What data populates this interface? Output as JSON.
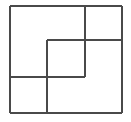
{
  "figure": {
    "title": "Overlapping rectangles pinwheel figure",
    "background_color": "#ffffff",
    "stroke_color": "#4a4a4a",
    "stroke_color_dark": "#3a3a3a",
    "stroke_width": 1.3,
    "canvas": {
      "width": 131,
      "height": 122
    },
    "outer_square": {
      "name": "outer-square",
      "left": 10,
      "top": 6,
      "right": 122,
      "bottom": 113,
      "width": 112,
      "height": 107
    },
    "inner_square": {
      "name": "inner-square",
      "left": 47,
      "top": 40,
      "right": 85,
      "bottom": 77,
      "width": 38,
      "height": 37
    },
    "segments": [
      {
        "id": "outer-top",
        "label": "Outer square top edge",
        "orientation": "horizontal",
        "x1": 10,
        "y1": 6,
        "x2": 122,
        "y2": 6
      },
      {
        "id": "outer-right",
        "label": "Outer square right edge",
        "orientation": "vertical",
        "x1": 122,
        "y1": 6,
        "x2": 122,
        "y2": 113
      },
      {
        "id": "outer-bottom",
        "label": "Outer square bottom edge",
        "orientation": "horizontal",
        "x1": 10,
        "y1": 113,
        "x2": 122,
        "y2": 113
      },
      {
        "id": "outer-left",
        "label": "Outer square left edge",
        "orientation": "vertical",
        "x1": 10,
        "y1": 6,
        "x2": 10,
        "y2": 113
      },
      {
        "id": "interior-vertical-upper",
        "label": "Upper interior vertical segment from top edge down to middle",
        "orientation": "vertical",
        "x1": 85,
        "y1": 6,
        "x2": 85,
        "y2": 77
      },
      {
        "id": "interior-horizontal-right",
        "label": "Interior horizontal segment from inner square across to right edge",
        "orientation": "horizontal",
        "x1": 47,
        "y1": 40,
        "x2": 122,
        "y2": 40
      },
      {
        "id": "interior-vertical-left-of-inner",
        "label": "Interior vertical segment forming inner square left side, continuing to bottom edge",
        "orientation": "vertical",
        "x1": 47,
        "y1": 40,
        "x2": 47,
        "y2": 113
      },
      {
        "id": "interior-horizontal-left",
        "label": "Interior horizontal segment from left edge across to inner square bottom-right",
        "orientation": "horizontal",
        "x1": 10,
        "y1": 77,
        "x2": 85,
        "y2": 77
      }
    ],
    "intersections": [
      {
        "id": "node-top-right-tee",
        "x": 85,
        "y": 6
      },
      {
        "id": "node-inner-top-left",
        "x": 47,
        "y": 40
      },
      {
        "id": "node-inner-top-right",
        "x": 85,
        "y": 40
      },
      {
        "id": "node-right-edge-tee",
        "x": 122,
        "y": 40
      },
      {
        "id": "node-left-edge-tee",
        "x": 10,
        "y": 77
      },
      {
        "id": "node-inner-bottom-left",
        "x": 47,
        "y": 77
      },
      {
        "id": "node-inner-bottom-right",
        "x": 85,
        "y": 77
      },
      {
        "id": "node-bottom-edge-tee",
        "x": 47,
        "y": 113
      }
    ],
    "regions": [
      {
        "id": "region-top-left",
        "label": "Large top-left rectangle",
        "left": 10,
        "top": 6,
        "right": 85,
        "bottom": 77
      },
      {
        "id": "region-top-right",
        "label": "Top-right rectangle",
        "left": 85,
        "top": 6,
        "right": 122,
        "bottom": 40
      },
      {
        "id": "region-right",
        "label": "Right rectangle",
        "left": 85,
        "top": 40,
        "right": 122,
        "bottom": 113
      },
      {
        "id": "region-center",
        "label": "Center square",
        "left": 47,
        "top": 40,
        "right": 85,
        "bottom": 77
      },
      {
        "id": "region-bottom-left",
        "label": "Bottom-left rectangle",
        "left": 10,
        "top": 77,
        "right": 47,
        "bottom": 113
      },
      {
        "id": "region-bottom-middle",
        "label": "Bottom-middle rectangle",
        "left": 47,
        "top": 77,
        "right": 85,
        "bottom": 113
      }
    ]
  }
}
